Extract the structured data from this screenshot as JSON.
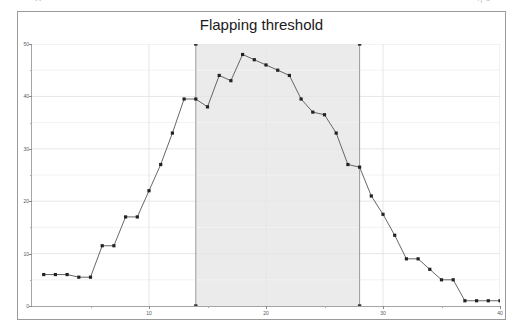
{
  "page": {
    "ghost_left": "ττ",
    "ghost_right": "η 3"
  },
  "chart": {
    "title": "Flapping threshold"
  },
  "chart_data": {
    "type": "line",
    "title": "Flapping threshold",
    "xlabel": "",
    "ylabel": "",
    "xlim": [
      0,
      40
    ],
    "ylim": [
      0,
      50
    ],
    "grid": true,
    "legend": null,
    "x_ticks": [
      10,
      20,
      30,
      40
    ],
    "x_minor_ticks": [
      5,
      15,
      25,
      35
    ],
    "y_ticks": [
      0,
      10,
      20,
      30,
      40,
      50
    ],
    "y_minor_ticks": [
      5,
      15,
      25,
      35,
      45
    ],
    "marker": "square",
    "line_color": "#555555",
    "marker_color": "#222222",
    "shaded_region": {
      "x_start": 14,
      "x_end": 28,
      "color": "#ebebeb",
      "label": "flapping window"
    },
    "series": [
      {
        "name": "state change percentage",
        "x": [
          1,
          2,
          3,
          4,
          5,
          6,
          7,
          8,
          9,
          10,
          11,
          12,
          13,
          14,
          15,
          16,
          17,
          18,
          19,
          20,
          21,
          22,
          23,
          24,
          25,
          26,
          27,
          28,
          29,
          30,
          31,
          32,
          33,
          34,
          35,
          36,
          37,
          38,
          39,
          40
        ],
        "y": [
          6,
          6,
          6,
          5.5,
          5.5,
          11.5,
          11.5,
          17,
          17,
          22,
          27,
          33,
          39.5,
          39.5,
          38,
          44,
          43,
          48,
          47,
          46,
          45,
          44,
          39.5,
          37,
          36.5,
          33,
          27,
          26.5,
          21,
          17.5,
          13.5,
          9,
          9,
          7,
          5,
          5,
          1,
          1,
          1,
          1
        ]
      }
    ],
    "boundary_markers": [
      {
        "x": 14,
        "y": 50
      },
      {
        "x": 14,
        "y": 0
      },
      {
        "x": 28,
        "y": 50
      },
      {
        "x": 28,
        "y": 0
      }
    ]
  }
}
